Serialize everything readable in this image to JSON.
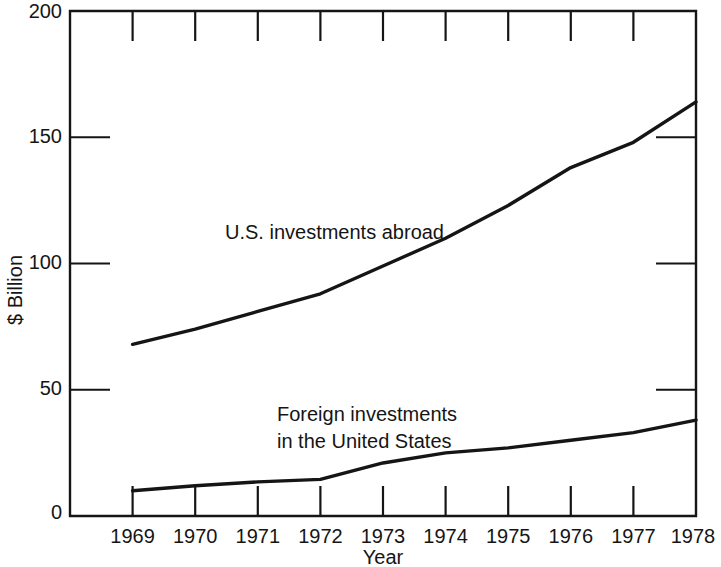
{
  "chart_data": {
    "type": "line",
    "title": "",
    "xlabel": "Year",
    "ylabel": "$ Billion",
    "x": [
      1969,
      1970,
      1971,
      1972,
      1973,
      1974,
      1975,
      1976,
      1977,
      1978
    ],
    "categories": [
      "1969",
      "1970",
      "1971",
      "1972",
      "1973",
      "1974",
      "1975",
      "1976",
      "1977",
      "1978"
    ],
    "xlim": [
      1968.0,
      1978.0
    ],
    "ylim": [
      0,
      200
    ],
    "yticks": [
      0,
      50,
      100,
      150,
      200
    ],
    "ytick_labels": [
      "0",
      "50",
      "100",
      "150",
      "200"
    ],
    "grid": false,
    "legend_position": "inline-annotations",
    "series": [
      {
        "name": "U.S. investments abroad",
        "values": [
          68,
          74,
          81,
          88,
          99,
          110,
          123,
          138,
          148,
          164
        ],
        "color": "#151515",
        "label_text": "U.S. investments abroad"
      },
      {
        "name": "Foreign investments in the United States",
        "values": [
          10,
          12,
          13.5,
          14.5,
          21,
          25,
          27,
          30,
          33,
          38
        ],
        "color": "#151515",
        "label_text_line1": "Foreign investments",
        "label_text_line2": "in the United States"
      }
    ],
    "annotations": [
      {
        "text": "U.S. investments abroad",
        "x": 1970.5,
        "y": 113
      },
      {
        "text": "Foreign investments",
        "x": 1972.0,
        "y": 47
      },
      {
        "text": "in the United States",
        "x": 1972.0,
        "y": 40
      }
    ]
  }
}
